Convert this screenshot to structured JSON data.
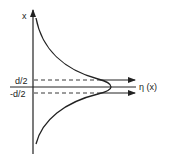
{
  "diagram": {
    "type": "profile-plot",
    "axes": {
      "vertical_label": "x",
      "horizontal_label": "η (x)"
    },
    "ticks": {
      "upper": "d/2",
      "lower": "-d/2"
    },
    "colors": {
      "line": "#222222",
      "background": "#ffffff"
    }
  }
}
